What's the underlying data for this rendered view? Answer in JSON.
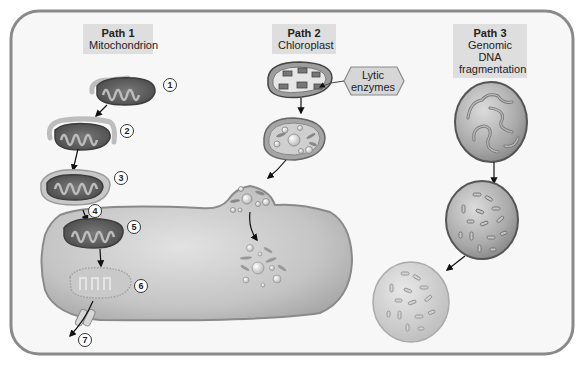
{
  "diagram": {
    "paths": [
      {
        "title": "Path 1",
        "subtitle_lines": [
          "Mitochondrion"
        ]
      },
      {
        "title": "Path 2",
        "subtitle_lines": [
          "Chloroplast"
        ]
      },
      {
        "title": "Path 3",
        "subtitle_lines": [
          "Genomic DNA",
          "fragmentation"
        ]
      }
    ],
    "callouts": {
      "lytic_enzymes": [
        "Lytic",
        "enzymes"
      ]
    },
    "step_numbers": [
      "1",
      "2",
      "3",
      "4",
      "5",
      "6",
      "7"
    ],
    "colors": {
      "frame_border": "#8a8a8a",
      "frame_fill": "#f6f6f6",
      "label_box": "#dedede",
      "mito_outer": "#5a5a5a",
      "mito_inner": "#9a9a9a",
      "membrane_wrap": "#b8b8b8",
      "cell_body": "#c8c8c8",
      "nucleus": "#a5a5a5",
      "arrow": "#111111"
    }
  }
}
